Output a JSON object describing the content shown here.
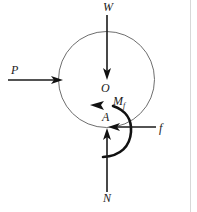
{
  "figure": {
    "type": "free-body-diagram",
    "background_color": "#ffffff",
    "stroke_color": "#1a1a1a",
    "circle_color": "#6e6e6e"
  },
  "body": {
    "shape": "circle",
    "center_label": "O",
    "contact_label": "A",
    "center": {
      "x": 106.5,
      "y": 79.5
    },
    "radius": 48
  },
  "labels": {
    "weight": "W",
    "applied_force": "P",
    "center": "O",
    "moment_symbol": "M",
    "moment_subscript": "f",
    "contact_point": "A",
    "friction": "f",
    "normal": "N"
  },
  "forces": [
    {
      "name": "weight",
      "symbol": "W",
      "direction": "down",
      "label_x": 107,
      "label_y": 11,
      "from": {
        "x": 107,
        "y": 15
      },
      "to": {
        "x": 107,
        "y": 78
      }
    },
    {
      "name": "applied-force",
      "symbol": "P",
      "direction": "right",
      "label_x": 14,
      "label_y": 74,
      "from": {
        "x": 8,
        "y": 80
      },
      "to": {
        "x": 62,
        "y": 80
      }
    },
    {
      "name": "friction-force",
      "symbol": "f",
      "direction": "left",
      "label_x": 160,
      "label_y": 132,
      "from": {
        "x": 156,
        "y": 127
      },
      "to": {
        "x": 109,
        "y": 127
      }
    },
    {
      "name": "normal-force",
      "symbol": "N",
      "direction": "up",
      "label_x": 107,
      "label_y": 201,
      "from": {
        "x": 107,
        "y": 192
      },
      "to": {
        "x": 107,
        "y": 129
      }
    }
  ],
  "moment": {
    "name": "rolling-resistance-moment",
    "symbol": "Mf",
    "sense": "counterclockwise",
    "label_x": 113,
    "label_y": 105
  }
}
